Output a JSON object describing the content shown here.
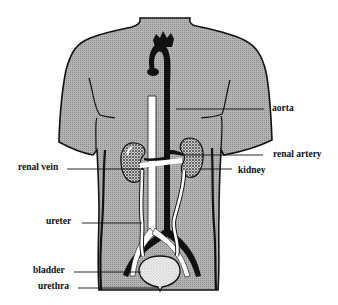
{
  "diagram": {
    "type": "anatomical-diagram",
    "colors": {
      "torso_fill": "#a8a8a8",
      "outline": "#111111",
      "artery": "#111111",
      "vein": "#ffffff",
      "bladder": "#e4e4e4",
      "background": "#ffffff"
    },
    "labels": {
      "aorta": "aorta",
      "renal_artery": "renal artery",
      "kidney": "kidney",
      "renal_vein": "renal vein",
      "ureter": "ureter",
      "bladder": "bladder",
      "urethra": "urethra"
    }
  }
}
